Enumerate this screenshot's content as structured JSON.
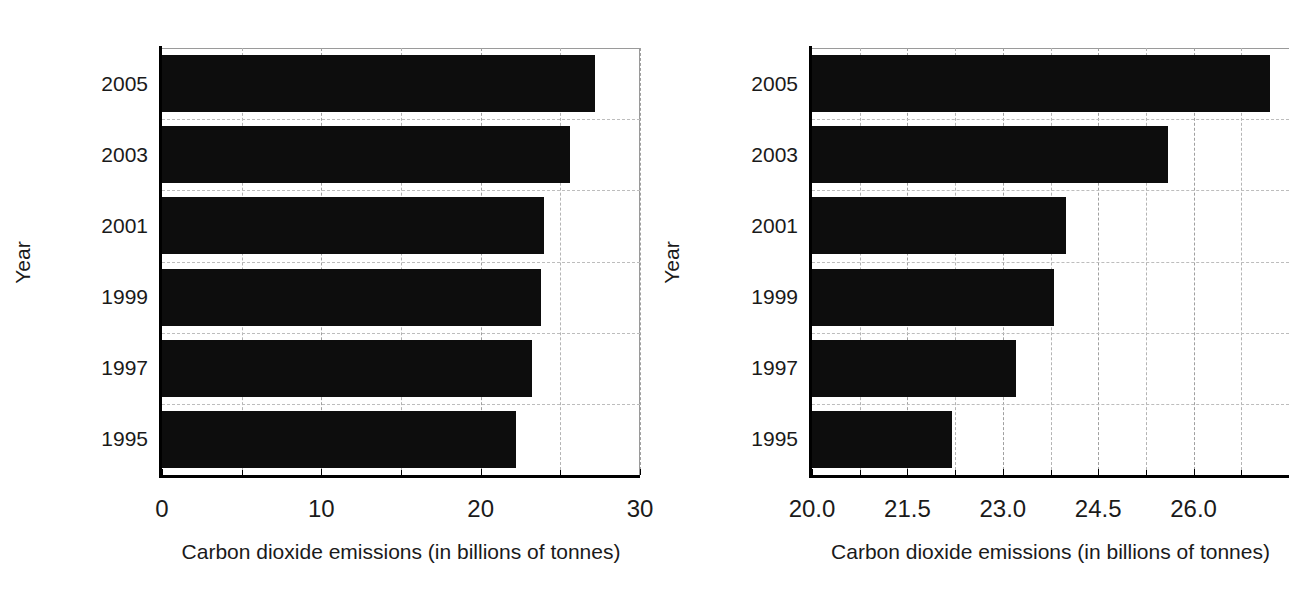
{
  "chart_data": [
    {
      "id": "left",
      "type": "bar",
      "orientation": "horizontal",
      "title": "",
      "xlabel": "Carbon dioxide emissions (in billions of tonnes)",
      "ylabel": "Year",
      "categories": [
        "2005",
        "2003",
        "2001",
        "1999",
        "1997",
        "1995"
      ],
      "values": [
        27.2,
        25.6,
        24.0,
        23.8,
        23.2,
        22.2
      ],
      "xlim": [
        0,
        30
      ],
      "xticks": [
        0,
        10,
        20,
        30
      ],
      "xtick_labels": [
        "0",
        "10",
        "20",
        "30"
      ],
      "xminor_ticks": [
        5,
        15,
        25
      ],
      "grid": true,
      "bar_color": "#0d0d0d",
      "legend": "none"
    },
    {
      "id": "right",
      "type": "bar",
      "orientation": "horizontal",
      "title": "",
      "xlabel": "Carbon dioxide emissions (in billions of tonnes)",
      "ylabel": "Year",
      "categories": [
        "2005",
        "2003",
        "2001",
        "1999",
        "1997",
        "1995"
      ],
      "values": [
        27.2,
        25.6,
        24.0,
        23.8,
        23.2,
        22.2
      ],
      "xlim": [
        20.0,
        27.5
      ],
      "xticks": [
        20.0,
        21.5,
        23.0,
        24.5,
        26.0
      ],
      "xtick_labels": [
        "20.0",
        "21.5",
        "23.0",
        "24.5",
        "26.0"
      ],
      "xminor_ticks": [
        20.75,
        22.25,
        23.75,
        25.25,
        26.75
      ],
      "grid": true,
      "bar_color": "#0d0d0d",
      "legend": "none"
    }
  ],
  "panels": {
    "left": {
      "ylabel": "Year",
      "xlabel": "Carbon dioxide emissions (in billions of tonnes)",
      "ytick_labels": [
        "2005",
        "2003",
        "2001",
        "1999",
        "1997",
        "1995"
      ],
      "xtick_labels": [
        "0",
        "10",
        "20",
        "30"
      ]
    },
    "right": {
      "ylabel": "Year",
      "xlabel": "Carbon dioxide emissions (in billions of tonnes)",
      "ytick_labels": [
        "2005",
        "2003",
        "2001",
        "1999",
        "1997",
        "1995"
      ],
      "xtick_labels": [
        "20.0",
        "21.5",
        "23.0",
        "24.5",
        "26.0"
      ]
    }
  }
}
